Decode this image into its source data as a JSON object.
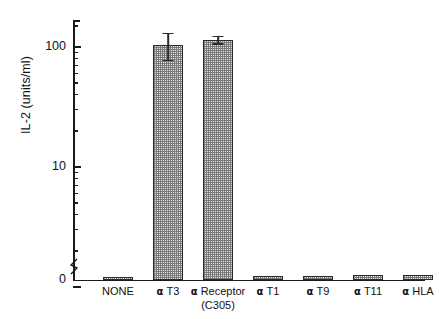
{
  "chart_data": {
    "type": "bar",
    "title": "",
    "xlabel": "",
    "ylabel": "IL-2 (units/ml)",
    "yscale": "log-with-zero-break",
    "ylim": [
      0,
      200
    ],
    "grid": false,
    "legend": null,
    "y_tick_labels": [
      "0",
      "10",
      "100"
    ],
    "axis_break": true,
    "categories": [
      "NONE",
      "α T3",
      "α Receptor (C305)",
      "α T1",
      "α T9",
      "α T11",
      "α HLA"
    ],
    "category_labels": [
      {
        "prefix": "",
        "line1": "NONE",
        "line2": ""
      },
      {
        "prefix": "α",
        "line1": "T3",
        "line2": ""
      },
      {
        "prefix": "α",
        "line1": "Receptor",
        "line2": "(C305)"
      },
      {
        "prefix": "α",
        "line1": "T1",
        "line2": ""
      },
      {
        "prefix": "α",
        "line1": "T9",
        "line2": ""
      },
      {
        "prefix": "α",
        "line1": "T11",
        "line2": ""
      },
      {
        "prefix": "α",
        "line1": "HLA",
        "line2": ""
      }
    ],
    "values": [
      0.55,
      105,
      115,
      0.75,
      0.85,
      0.95,
      1.05
    ],
    "errors": [
      0,
      28,
      10,
      0,
      0,
      0,
      0
    ],
    "error_style": "both",
    "colors": {
      "axis": "#1a1a1a",
      "bar_fill": "#e2e2e2",
      "bar_stipple": "#6e6e6e",
      "bar_edge": "#2a2a2a",
      "text": "#111111",
      "background": "#ffffff"
    }
  }
}
